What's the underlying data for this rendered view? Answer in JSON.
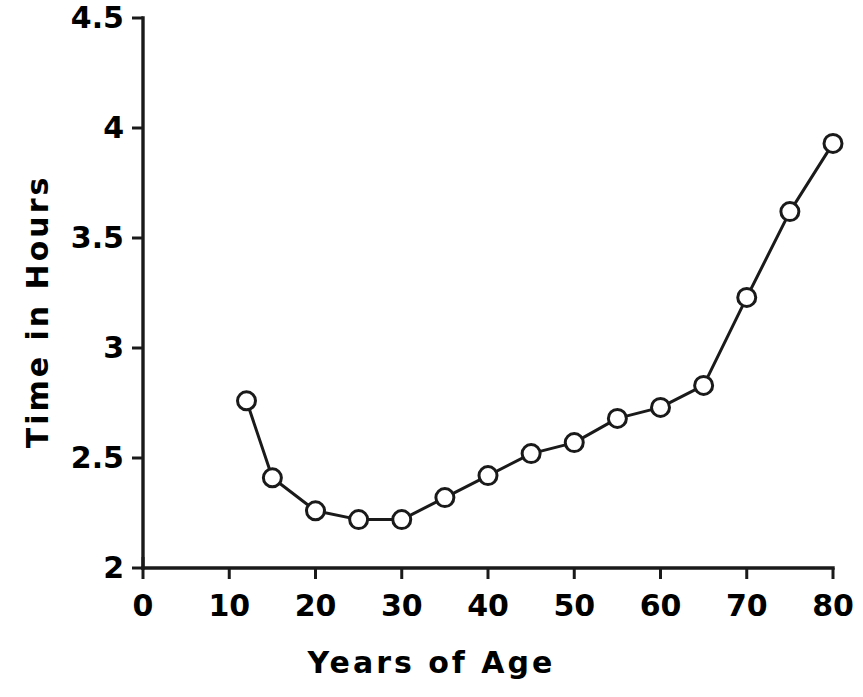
{
  "chart_data": {
    "type": "line",
    "title": "",
    "xlabel": "Years of Age",
    "ylabel": "Time in Hours",
    "xlim": [
      0,
      80
    ],
    "ylim": [
      2,
      4.5
    ],
    "xticks": [
      0,
      10,
      20,
      30,
      40,
      50,
      60,
      70,
      80
    ],
    "xtick_labels": [
      "0",
      "10",
      "20",
      "30",
      "40",
      "50",
      "60",
      "70",
      "80"
    ],
    "yticks": [
      2,
      2.5,
      3,
      3.5,
      4,
      4.5
    ],
    "ytick_labels": [
      "2",
      "2.5",
      "3",
      "3.5",
      "4",
      "4.5"
    ],
    "grid": false,
    "legend": false,
    "marker": "open-circle",
    "line_color": "#1a1a1a",
    "marker_face_color": "#ffffff",
    "marker_edge_color": "#1a1a1a",
    "x": [
      12,
      15,
      20,
      25,
      30,
      35,
      40,
      45,
      50,
      55,
      60,
      65,
      70,
      75,
      80
    ],
    "values": [
      2.76,
      2.41,
      2.26,
      2.22,
      2.22,
      2.32,
      2.42,
      2.52,
      2.57,
      2.68,
      2.73,
      2.83,
      3.23,
      3.62,
      3.93
    ],
    "series": [
      {
        "name": "Time in Hours",
        "x": [
          12,
          15,
          20,
          25,
          30,
          35,
          40,
          45,
          50,
          55,
          60,
          65,
          70,
          75,
          80
        ],
        "values": [
          2.76,
          2.41,
          2.26,
          2.22,
          2.22,
          2.32,
          2.42,
          2.52,
          2.57,
          2.68,
          2.73,
          2.83,
          3.23,
          3.62,
          3.93
        ]
      }
    ]
  }
}
